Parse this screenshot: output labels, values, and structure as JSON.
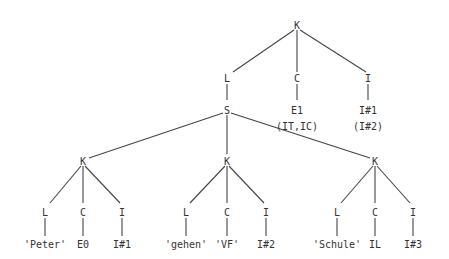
{
  "tree": {
    "root": {
      "label": "K"
    },
    "level1": {
      "L": "L",
      "C": "C",
      "I": "I",
      "E1": "E1",
      "E1_sub": "(IT,IC)",
      "I1": "I#1",
      "I1_sub": "(I#2)"
    },
    "S": "S",
    "subtrees": [
      {
        "K": "K",
        "L": "L",
        "C": "C",
        "I": "I",
        "lex": "'Peter'",
        "cat": "E0",
        "idx": "I#1"
      },
      {
        "K": "K",
        "L": "L",
        "C": "C",
        "I": "I",
        "lex": "'gehen'",
        "cat": "'VF'",
        "idx": "I#2"
      },
      {
        "K": "K",
        "L": "L",
        "C": "C",
        "I": "I",
        "lex": "'Schule'",
        "cat": "IL",
        "idx": "I#3"
      }
    ]
  }
}
